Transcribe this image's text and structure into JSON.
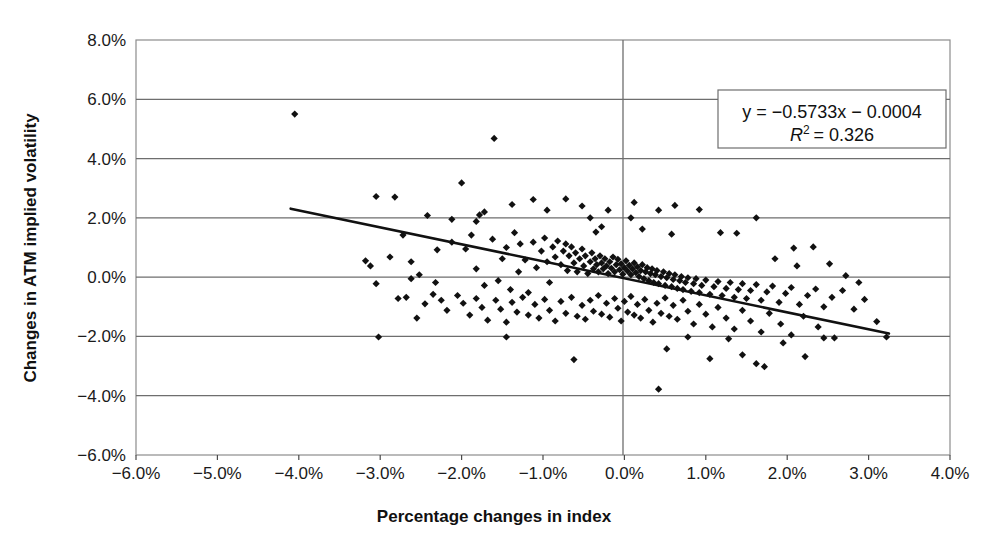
{
  "chart_data": {
    "type": "scatter",
    "title": "",
    "xlabel": "Percentage changes in index",
    "ylabel": "Changes in ATM implied volatility",
    "xlim": [
      -6.0,
      4.0
    ],
    "ylim": [
      -6.0,
      8.0
    ],
    "xticks": [
      -6.0,
      -5.0,
      -4.0,
      -3.0,
      -2.0,
      -1.0,
      0.0,
      1.0,
      2.0,
      3.0,
      4.0
    ],
    "yticks": [
      -6.0,
      -4.0,
      -2.0,
      0.0,
      2.0,
      4.0,
      6.0,
      8.0
    ],
    "xtick_labels": [
      "-6.0%",
      "-5.0%",
      "-4.0%",
      "-3.0%",
      "-2.0%",
      "-1.0%",
      "0.0%",
      "1.0%",
      "2.0%",
      "3.0%",
      "4.0%"
    ],
    "ytick_labels": [
      "-6.0%",
      "-4.0%",
      "-2.0%",
      "0.0%",
      "2.0%",
      "4.0%",
      "6.0%",
      "8.0%"
    ],
    "grid": "horizontal",
    "legend": "none",
    "marker": "diamond",
    "marker_color": "#111111",
    "annotation": {
      "equation": "y = −0.5733x − 0.0004",
      "r_squared_label": "R",
      "r_squared_exponent": "2",
      "r_squared_value": "= 0.326",
      "position": "top-right"
    },
    "trendline": {
      "type": "linear",
      "slope": -0.5733,
      "intercept": -0.0004,
      "x_start": -4.1,
      "x_end": 3.25,
      "color": "#111111"
    },
    "points": [
      [
        -4.05,
        5.5
      ],
      [
        -1.6,
        4.68
      ],
      [
        -3.05,
        2.72
      ],
      [
        -2.82,
        2.7
      ],
      [
        -2.42,
        2.08
      ],
      [
        -2.0,
        3.18
      ],
      [
        -1.78,
        2.1
      ],
      [
        -1.72,
        2.2
      ],
      [
        -1.38,
        2.45
      ],
      [
        -1.12,
        2.62
      ],
      [
        -0.95,
        2.26
      ],
      [
        -0.72,
        2.64
      ],
      [
        -0.52,
        2.4
      ],
      [
        -0.42,
        2.0
      ],
      [
        -0.2,
        2.26
      ],
      [
        0.08,
        2.0
      ],
      [
        0.12,
        2.52
      ],
      [
        0.42,
        2.26
      ],
      [
        0.62,
        2.42
      ],
      [
        0.92,
        2.28
      ],
      [
        1.62,
        2.0
      ],
      [
        -3.12,
        0.38
      ],
      [
        -3.05,
        -0.22
      ],
      [
        -2.72,
        1.42
      ],
      [
        -2.62,
        0.52
      ],
      [
        -2.45,
        -0.9
      ],
      [
        -2.3,
        0.92
      ],
      [
        -2.12,
        1.18
      ],
      [
        -1.95,
        0.95
      ],
      [
        -1.88,
        1.42
      ],
      [
        -1.82,
        0.28
      ],
      [
        -1.72,
        -0.28
      ],
      [
        -1.62,
        1.28
      ],
      [
        -1.55,
        -0.12
      ],
      [
        -1.5,
        0.62
      ],
      [
        -1.45,
        1.0
      ],
      [
        -1.4,
        -0.42
      ],
      [
        -1.35,
        1.5
      ],
      [
        -1.3,
        0.18
      ],
      [
        -1.28,
        1.12
      ],
      [
        -1.22,
        0.58
      ],
      [
        -1.18,
        -0.52
      ],
      [
        -1.12,
        1.18
      ],
      [
        -1.08,
        0.32
      ],
      [
        -1.02,
        0.88
      ],
      [
        -0.98,
        1.32
      ],
      [
        -0.95,
        0.52
      ],
      [
        -0.92,
        -0.18
      ],
      [
        -0.88,
        1.02
      ],
      [
        -0.85,
        0.68
      ],
      [
        -0.82,
        1.22
      ],
      [
        -0.78,
        0.42
      ],
      [
        -0.75,
        0.88
      ],
      [
        -0.72,
        1.12
      ],
      [
        -0.7,
        0.22
      ],
      [
        -0.68,
        0.72
      ],
      [
        -0.65,
        1.02
      ],
      [
        -0.62,
        0.48
      ],
      [
        -0.6,
        0.82
      ],
      [
        -0.58,
        0.18
      ],
      [
        -0.55,
        0.62
      ],
      [
        -0.52,
        0.95
      ],
      [
        -0.5,
        0.38
      ],
      [
        -0.48,
        0.72
      ],
      [
        -0.45,
        0.12
      ],
      [
        -0.42,
        0.52
      ],
      [
        -0.4,
        0.82
      ],
      [
        -0.38,
        0.28
      ],
      [
        -0.36,
        0.62
      ],
      [
        -0.34,
        0.42
      ],
      [
        -0.32,
        0.18
      ],
      [
        -0.3,
        0.72
      ],
      [
        -0.28,
        0.48
      ],
      [
        -0.26,
        0.28
      ],
      [
        -0.24,
        0.62
      ],
      [
        -0.22,
        0.38
      ],
      [
        -0.2,
        0.12
      ],
      [
        -0.18,
        0.52
      ],
      [
        -0.16,
        0.3
      ],
      [
        -0.14,
        0.68
      ],
      [
        -0.12,
        0.18
      ],
      [
        -0.1,
        0.42
      ],
      [
        -0.08,
        0.6
      ],
      [
        -0.06,
        0.25
      ],
      [
        -0.04,
        0.45
      ],
      [
        -0.02,
        0.1
      ],
      [
        0.0,
        0.32
      ],
      [
        0.02,
        0.55
      ],
      [
        0.04,
        0.2
      ],
      [
        0.06,
        0.4
      ],
      [
        0.08,
        0.08
      ],
      [
        0.1,
        0.28
      ],
      [
        0.12,
        0.48
      ],
      [
        0.14,
        0.15
      ],
      [
        0.16,
        0.35
      ],
      [
        0.18,
        0.02
      ],
      [
        0.2,
        0.22
      ],
      [
        0.22,
        0.42
      ],
      [
        0.24,
        -0.05
      ],
      [
        0.26,
        0.18
      ],
      [
        0.28,
        0.32
      ],
      [
        0.3,
        -0.12
      ],
      [
        0.32,
        0.12
      ],
      [
        0.34,
        0.28
      ],
      [
        0.36,
        -0.18
      ],
      [
        0.38,
        0.08
      ],
      [
        0.4,
        0.22
      ],
      [
        0.42,
        -0.22
      ],
      [
        0.45,
        0.02
      ],
      [
        0.48,
        0.18
      ],
      [
        0.5,
        -0.28
      ],
      [
        0.52,
        -0.02
      ],
      [
        0.55,
        0.12
      ],
      [
        0.58,
        -0.32
      ],
      [
        0.6,
        -0.08
      ],
      [
        0.62,
        0.08
      ],
      [
        0.65,
        -0.38
      ],
      [
        0.68,
        -0.12
      ],
      [
        0.7,
        0.02
      ],
      [
        0.72,
        -0.42
      ],
      [
        0.75,
        -0.18
      ],
      [
        0.78,
        -0.02
      ],
      [
        0.82,
        -0.48
      ],
      [
        0.85,
        -0.22
      ],
      [
        0.88,
        -0.05
      ],
      [
        0.92,
        -0.52
      ],
      [
        0.95,
        -0.28
      ],
      [
        1.0,
        -0.1
      ],
      [
        1.05,
        -0.58
      ],
      [
        1.1,
        -0.32
      ],
      [
        1.15,
        -0.15
      ],
      [
        1.2,
        -0.62
      ],
      [
        1.25,
        -0.38
      ],
      [
        1.3,
        -0.18
      ],
      [
        1.35,
        -0.68
      ],
      [
        1.4,
        -0.42
      ],
      [
        1.45,
        -0.22
      ],
      [
        1.5,
        -0.72
      ],
      [
        1.55,
        -0.45
      ],
      [
        1.62,
        -0.25
      ],
      [
        1.68,
        -0.78
      ],
      [
        1.75,
        -0.5
      ],
      [
        1.82,
        -0.3
      ],
      [
        1.9,
        -0.85
      ],
      [
        1.98,
        -0.55
      ],
      [
        2.05,
        -0.35
      ],
      [
        2.15,
        -0.92
      ],
      [
        2.25,
        -0.62
      ],
      [
        2.35,
        -0.4
      ],
      [
        2.45,
        -1.0
      ],
      [
        2.55,
        -0.68
      ],
      [
        2.68,
        -0.45
      ],
      [
        2.82,
        -1.08
      ],
      [
        2.95,
        -0.75
      ],
      [
        3.1,
        -1.5
      ],
      [
        3.22,
        -2.02
      ],
      [
        -2.78,
        -0.72
      ],
      [
        -2.68,
        -0.68
      ],
      [
        -2.55,
        -1.38
      ],
      [
        -2.35,
        -0.58
      ],
      [
        -2.25,
        -0.78
      ],
      [
        -2.18,
        -1.12
      ],
      [
        -2.05,
        -0.62
      ],
      [
        -1.98,
        -0.88
      ],
      [
        -1.9,
        -1.28
      ],
      [
        -1.82,
        -0.72
      ],
      [
        -1.75,
        -1.02
      ],
      [
        -1.68,
        -1.45
      ],
      [
        -1.58,
        -0.78
      ],
      [
        -1.52,
        -1.08
      ],
      [
        -1.45,
        -1.52
      ],
      [
        -1.38,
        -0.85
      ],
      [
        -1.32,
        -1.18
      ],
      [
        -1.25,
        -0.68
      ],
      [
        -1.18,
        -1.28
      ],
      [
        -1.1,
        -0.92
      ],
      [
        -1.05,
        -1.38
      ],
      [
        -0.98,
        -0.75
      ],
      [
        -0.92,
        -1.12
      ],
      [
        -0.85,
        -1.48
      ],
      [
        -0.78,
        -0.82
      ],
      [
        -0.72,
        -1.22
      ],
      [
        -0.65,
        -0.68
      ],
      [
        -0.58,
        -1.32
      ],
      [
        -0.52,
        -0.95
      ],
      [
        -0.48,
        -1.42
      ],
      [
        -0.42,
        -0.78
      ],
      [
        -0.38,
        -1.15
      ],
      [
        -0.32,
        -0.62
      ],
      [
        -0.28,
        -1.25
      ],
      [
        -0.22,
        -0.88
      ],
      [
        -0.18,
        -1.35
      ],
      [
        -0.12,
        -0.72
      ],
      [
        -0.08,
        -1.05
      ],
      [
        -0.04,
        -1.48
      ],
      [
        0.0,
        -0.82
      ],
      [
        0.04,
        -1.18
      ],
      [
        0.08,
        -0.65
      ],
      [
        0.12,
        -1.28
      ],
      [
        0.16,
        -0.92
      ],
      [
        0.2,
        -1.38
      ],
      [
        0.25,
        -0.75
      ],
      [
        0.3,
        -1.12
      ],
      [
        0.35,
        -1.52
      ],
      [
        0.4,
        -0.88
      ],
      [
        0.45,
        -1.22
      ],
      [
        0.5,
        -0.7
      ],
      [
        0.55,
        -1.32
      ],
      [
        0.6,
        -0.95
      ],
      [
        0.65,
        -1.42
      ],
      [
        0.72,
        -0.78
      ],
      [
        0.78,
        -1.15
      ],
      [
        0.85,
        -1.58
      ],
      [
        0.92,
        -0.92
      ],
      [
        1.0,
        -1.25
      ],
      [
        1.08,
        -1.68
      ],
      [
        1.15,
        -1.02
      ],
      [
        1.25,
        -1.38
      ],
      [
        1.35,
        -1.75
      ],
      [
        1.45,
        -1.12
      ],
      [
        1.55,
        -1.48
      ],
      [
        1.68,
        -1.85
      ],
      [
        1.78,
        -1.22
      ],
      [
        1.92,
        -1.58
      ],
      [
        2.05,
        -1.95
      ],
      [
        2.2,
        -1.32
      ],
      [
        2.38,
        -1.68
      ],
      [
        2.58,
        -2.05
      ],
      [
        -3.02,
        -2.02
      ],
      [
        -1.45,
        -2.02
      ],
      [
        -0.62,
        -2.78
      ],
      [
        0.52,
        -2.42
      ],
      [
        0.78,
        -2.02
      ],
      [
        1.05,
        -2.75
      ],
      [
        1.28,
        -2.08
      ],
      [
        1.45,
        -2.62
      ],
      [
        1.62,
        -2.92
      ],
      [
        1.72,
        -3.02
      ],
      [
        1.95,
        -2.22
      ],
      [
        2.22,
        -2.68
      ],
      [
        2.45,
        -2.05
      ],
      [
        0.42,
        -3.78
      ],
      [
        -2.12,
        1.95
      ],
      [
        -1.82,
        1.88
      ],
      [
        -0.28,
        1.7
      ],
      [
        0.22,
        1.62
      ],
      [
        -0.35,
        1.52
      ],
      [
        0.58,
        1.45
      ],
      [
        1.18,
        1.5
      ],
      [
        1.38,
        1.48
      ],
      [
        2.08,
        0.98
      ],
      [
        2.32,
        1.02
      ],
      [
        2.72,
        0.05
      ],
      [
        2.88,
        -0.18
      ],
      [
        -2.88,
        0.68
      ],
      [
        -2.52,
        0.08
      ],
      [
        -2.32,
        -0.18
      ],
      [
        -2.62,
        -0.05
      ],
      [
        -3.18,
        0.55
      ],
      [
        1.85,
        0.62
      ],
      [
        2.12,
        0.38
      ],
      [
        2.52,
        0.45
      ]
    ]
  }
}
